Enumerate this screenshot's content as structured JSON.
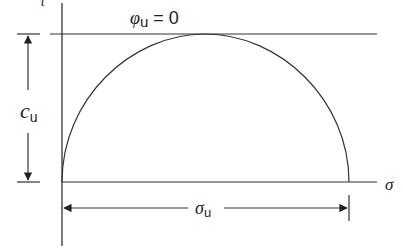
{
  "diagram": {
    "colors": {
      "stroke": "#333333",
      "text": "#222222",
      "background": "#ffffff"
    },
    "labels": {
      "y_axis": "τ",
      "x_axis": "σ",
      "envelope_symbol": "φ",
      "envelope_sub": "u",
      "envelope_rest": " = 0",
      "cohesion_symbol": "c",
      "cohesion_sub": "u",
      "stress_symbol": "σ",
      "stress_sub": "u"
    },
    "geometry": {
      "origin": [
        62,
        182
      ],
      "envelope_y": 34,
      "circle_right_x": 349
    }
  }
}
